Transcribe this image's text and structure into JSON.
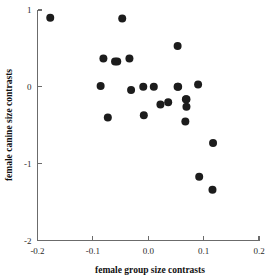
{
  "chart_data": {
    "type": "scatter",
    "title": "",
    "xlabel": "female group size contrasts",
    "ylabel": "female canine size contrasts",
    "xlim": [
      -0.2,
      0.2
    ],
    "ylim": [
      -2,
      1
    ],
    "xticks": [
      -0.2,
      -0.1,
      0.0,
      0.1,
      0.2
    ],
    "xticklabels": [
      "-0.2",
      "-0.1",
      "0.0",
      "0.1",
      "0.2"
    ],
    "yticks": [
      1,
      0,
      -1,
      -2
    ],
    "yticklabels": [
      "1",
      "0",
      "-1",
      "-2"
    ],
    "grid": false,
    "legend": null,
    "marker": "filled-circle",
    "marker_color": "#1c1c1c",
    "marker_size": 4.0,
    "n_points": 25,
    "points": [
      {
        "x": -0.177,
        "y": 0.9
      },
      {
        "x": -0.047,
        "y": 0.89
      },
      {
        "x": 0.053,
        "y": 0.53
      },
      {
        "x": -0.081,
        "y": 0.37
      },
      {
        "x": -0.056,
        "y": 0.33
      },
      {
        "x": -0.034,
        "y": 0.37
      },
      {
        "x": -0.086,
        "y": 0.01
      },
      {
        "x": -0.031,
        "y": -0.04
      },
      {
        "x": -0.009,
        "y": 0.0
      },
      {
        "x": 0.01,
        "y": 0.0
      },
      {
        "x": 0.054,
        "y": 0.0
      },
      {
        "x": 0.09,
        "y": 0.03
      },
      {
        "x": 0.022,
        "y": -0.23
      },
      {
        "x": 0.036,
        "y": -0.2
      },
      {
        "x": 0.069,
        "y": -0.16
      },
      {
        "x": 0.069,
        "y": -0.26
      },
      {
        "x": -0.073,
        "y": -0.4
      },
      {
        "x": -0.008,
        "y": -0.37
      },
      {
        "x": 0.067,
        "y": -0.45
      },
      {
        "x": 0.117,
        "y": -0.73
      },
      {
        "x": 0.092,
        "y": -1.17
      },
      {
        "x": 0.116,
        "y": -1.34
      },
      {
        "x": -0.06,
        "y": 0.33
      },
      {
        "x": 0.053,
        "y": 0.0
      },
      {
        "x": 0.068,
        "y": -0.16
      }
    ]
  },
  "axes": {
    "x_label": "female group size contrasts",
    "y_label": "female canine size contrasts"
  }
}
